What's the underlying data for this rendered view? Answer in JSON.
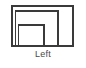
{
  "figure": {
    "caption": "Left",
    "background_color": "#ffffff",
    "stroke_color": "#3a3a3a",
    "caption_color": "#4a4a4a",
    "stroke_width": 1.6,
    "shape_name": "nested-rectangular-spiral",
    "viewbox": "0 0 86 68",
    "outer_rectangle": {
      "name": "outer-frame",
      "x": 12,
      "y": 6,
      "width": 61,
      "height": 40
    },
    "spiral_path_outer": {
      "name": "spiral-arm-outer",
      "d": "M 15.5 45.5 L 15.5 11 L 58 11 L 58 45.5"
    },
    "spiral_path_inner": {
      "name": "spiral-arm-inner",
      "d": "M 18.5 45.5 L 18.5 25 L 44 25 L 44 45.5"
    }
  }
}
